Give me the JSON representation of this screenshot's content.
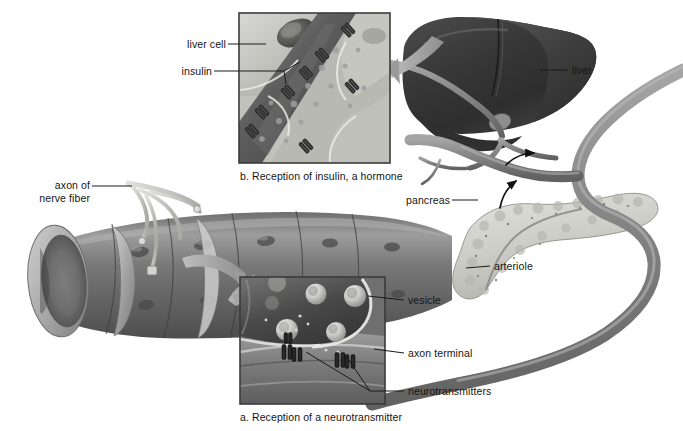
{
  "figure": {
    "background_color": "#ffffff",
    "palette": {
      "vessel_gray": "#8c8c8c",
      "vessel_dark": "#5a5a5a",
      "vessel_light": "#c8c8c8",
      "liver_dark": "#3a3a3a",
      "liver_mid": "#575757",
      "pancreas_light": "#d8d8d4",
      "inset_border": "#3b3b3b",
      "leader_line": "#222222",
      "arrow_gray": "#9a9a9a",
      "text": "#151515"
    }
  },
  "labels": {
    "liver_cell": "liver cell",
    "insulin": "insulin",
    "liver": "liver",
    "pancreas": "pancreas",
    "arteriole": "arteriole",
    "axon_of": "axon of",
    "nerve_fiber": "nerve fiber",
    "vesicle": "vesicle",
    "axon_terminal": "axon terminal",
    "neurotransmitters": "neurotransmitters"
  },
  "captions": {
    "panel_a": "a. Reception of a neurotransmitter",
    "panel_b": "b. Reception of insulin, a hormone"
  },
  "panels": [
    {
      "id": "b",
      "caption": "b. Reception of insulin, a hormone",
      "x": 239,
      "y": 13,
      "width": 151,
      "height": 150,
      "callouts": [
        "liver cell",
        "insulin"
      ],
      "depicts": "Insulin molecules binding receptors on a capillary wall beside liver cells"
    },
    {
      "id": "a",
      "caption": "a. Reception of a neurotransmitter",
      "x": 240,
      "y": 277,
      "width": 145,
      "height": 127,
      "callouts": [
        "vesicle",
        "axon terminal",
        "neurotransmitters"
      ],
      "depicts": "Axon terminal with vesicles releasing neurotransmitter onto smooth muscle receptors"
    }
  ],
  "structures": [
    {
      "name": "blood-vessel",
      "note": "large cut-away vessel running lower-left to right"
    },
    {
      "name": "liver",
      "note": "dark lobed organ upper right"
    },
    {
      "name": "pancreas",
      "note": "pale granular organ right of center"
    },
    {
      "name": "arteriole",
      "note": "gray tube looping at lower right"
    },
    {
      "name": "nerve-fiber",
      "note": "pale axon branching onto the vessel at left"
    }
  ]
}
